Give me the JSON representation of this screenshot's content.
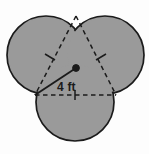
{
  "figure": {
    "type": "geometry-diagram",
    "measurement_label": "4 ft",
    "measurement_value": 4,
    "measurement_unit": "ft",
    "shape_count": 3,
    "shape_name": "circle",
    "fill_color": "#9a9a9a",
    "stroke_color": "#1b1b1b",
    "dash_color": "#1b1b1b",
    "background_color": "#fdfdfd",
    "circles": [
      {
        "name": "top-left-circle",
        "cx": 46,
        "cy": 55,
        "r": 39
      },
      {
        "name": "top-right-circle",
        "cx": 105,
        "cy": 55,
        "r": 39
      },
      {
        "name": "bottom-circle",
        "cx": 75,
        "cy": 102,
        "r": 39
      }
    ],
    "center_dot": {
      "name": "center-point",
      "cx": 76,
      "cy": 68,
      "r": 3
    },
    "triangle_vertices": [
      {
        "x": 76,
        "y": 16
      },
      {
        "x": 35,
        "y": 95
      },
      {
        "x": 116,
        "y": 95
      }
    ],
    "radius_segment": {
      "x1": 35,
      "y1": 95,
      "x2": 76,
      "y2": 68
    },
    "label_position": {
      "left": 57,
      "top": 81
    }
  }
}
